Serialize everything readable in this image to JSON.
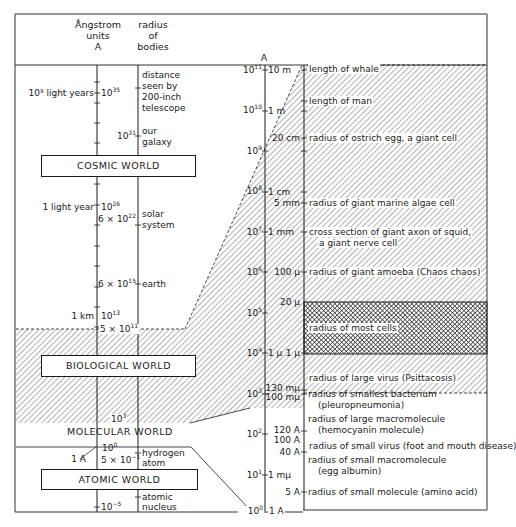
{
  "header": {
    "col_angstrom": [
      "Ångstrom",
      "units",
      "A"
    ],
    "col_radius": [
      "radius",
      "of",
      "bodies"
    ],
    "col_right_unit": "A"
  },
  "worlds": {
    "cosmic": "COSMIC WORLD",
    "biological": "BIOLOGICAL WORLD",
    "molecular": "MOLECULAR WORLD",
    "atomic": "ATOMIC WORLD"
  },
  "left_scale": {
    "ticks": [
      {
        "label_left": "10⁹ light years",
        "value_base": "10",
        "value_exp": "35"
      },
      {
        "value_base": "10",
        "value_exp": "31",
        "body": "our galaxy"
      },
      {
        "label_left": "1 light year",
        "value_base": "10",
        "value_exp": "26"
      },
      {
        "value_base": "6 × 10",
        "value_exp": "22",
        "body": "solar system"
      },
      {
        "value_base": "6 × 10",
        "value_exp": "15",
        "body": "earth"
      },
      {
        "label_left": "1 km",
        "value_base": "10",
        "value_exp": "13"
      },
      {
        "value_base": "5 × 10",
        "value_exp": "11"
      },
      {
        "value_base": "10",
        "value_exp": "3"
      },
      {
        "label_left": "1 A",
        "value_base": "10",
        "value_exp": "0"
      },
      {
        "value_base": "5 × 10",
        "value_exp": "−1",
        "body": "hydrogen atom"
      },
      {
        "value_base": "10",
        "value_exp": "−5",
        "body": "atomic nucleus"
      }
    ],
    "telescope": [
      "distance",
      "seen by",
      "200-inch",
      "telescope"
    ],
    "galaxy": [
      "our",
      "galaxy"
    ],
    "solar": [
      "solar",
      "system"
    ],
    "earth": "earth",
    "hydrogen": [
      "hydrogen",
      "atom"
    ],
    "nucleus": [
      "atomic",
      "nucleus"
    ],
    "one_light_year": "1 light year",
    "billion_ly": "10⁹ light years",
    "one_km": "1 km",
    "one_A": "1 A"
  },
  "right_scale": {
    "powers": [
      {
        "base": "10",
        "exp": "11"
      },
      {
        "base": "10",
        "exp": "10"
      },
      {
        "base": "10",
        "exp": "9"
      },
      {
        "base": "10",
        "exp": "8"
      },
      {
        "base": "10",
        "exp": "7"
      },
      {
        "base": "10",
        "exp": "6"
      },
      {
        "base": "10",
        "exp": "5"
      },
      {
        "base": "10",
        "exp": "4"
      },
      {
        "base": "10",
        "exp": "3"
      },
      {
        "base": "10",
        "exp": "2"
      },
      {
        "base": "10",
        "exp": "1"
      },
      {
        "base": "10",
        "exp": "0"
      }
    ],
    "units": [
      "10 m",
      "1 m",
      "1 cm",
      "1 mm",
      "1 μ",
      "1 mμ",
      "1 A"
    ],
    "sizes": [
      "20 cm",
      "5 mm",
      "100 μ",
      "20 μ",
      "1 μ",
      "130 mμ",
      "100 mμ",
      "120 A",
      "100 A",
      "40 A",
      "5 A"
    ],
    "descriptions": [
      "length of whale",
      "length of man",
      "radius of ostrich egg, a giant cell",
      "radius of giant marine algae cell",
      "cross section of giant axon of squid,",
      "a giant nerve cell",
      "radius of giant amoeba (Chaos chaos)",
      "radius of most cells",
      "radius of large virus (Psittacosis)",
      "radius of smallest bacterium",
      "(pleuropneumonia)",
      "radius of large macromolecule",
      "(hemocyanin molecule)",
      "radius of small virus (foot and mouth disease)",
      "radius of small macromolecule",
      "(egg albumin)",
      "radius of small molecule (amino acid)"
    ]
  },
  "colors": {
    "ink": "#1a1a1a",
    "paper": "#ffffff",
    "hatch": "#6a6a6a"
  }
}
